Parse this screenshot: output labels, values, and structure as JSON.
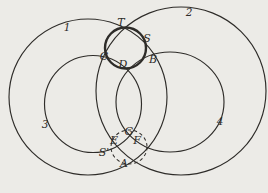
{
  "labels": {
    "circle1": "1",
    "circle2": "2",
    "circle3": "3",
    "circle4": "4",
    "T": "T",
    "S": "S",
    "C": "C",
    "D": "D",
    "B": "B",
    "G": "G",
    "E": "E",
    "F": "F",
    "S_prime": "S'",
    "A": "A"
  },
  "colors": {
    "background": "#ecebe7",
    "line": "#2e2c29"
  }
}
